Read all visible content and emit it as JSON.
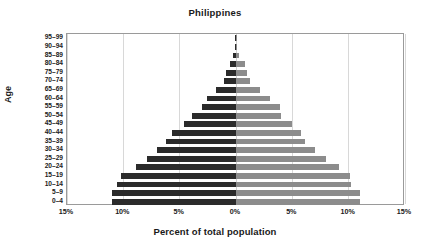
{
  "chart_data": {
    "type": "bar",
    "subtype": "population-pyramid",
    "title": "Philippines",
    "xlabel": "Percent of total population",
    "ylabel": "Age",
    "grid": true,
    "legend": "none",
    "orientation": "horizontal",
    "xlim": [
      -15,
      15
    ],
    "x_tick_values": [
      -15,
      -10,
      -5,
      0,
      5,
      10,
      15
    ],
    "x_tick_labels": [
      "15%",
      "10%",
      "5%",
      "0%",
      "5%",
      "10%",
      "15%"
    ],
    "categories": [
      "0–4",
      "5–9",
      "10–14",
      "15–19",
      "20–24",
      "25–29",
      "30–34",
      "35–39",
      "40–44",
      "45–49",
      "50–54",
      "55–59",
      "60–64",
      "65–69",
      "70–74",
      "75–79",
      "80–84",
      "85–89",
      "90–94",
      "95–99"
    ],
    "series": [
      {
        "name": "Left",
        "side": "left",
        "color": "#2b2b2b",
        "values": [
          11.0,
          11.0,
          10.6,
          10.2,
          8.9,
          7.9,
          7.0,
          6.2,
          5.7,
          4.6,
          3.9,
          3.0,
          2.6,
          1.8,
          1.1,
          0.9,
          0.5,
          0.25,
          0.1,
          0.04
        ]
      },
      {
        "name": "Right",
        "side": "right",
        "color": "#8c8c8c",
        "values": [
          11.0,
          11.0,
          10.2,
          10.1,
          9.1,
          8.0,
          7.0,
          6.1,
          5.8,
          5.0,
          4.0,
          3.9,
          3.0,
          2.1,
          1.2,
          1.0,
          0.8,
          0.3,
          0.1,
          0.04
        ]
      }
    ]
  }
}
